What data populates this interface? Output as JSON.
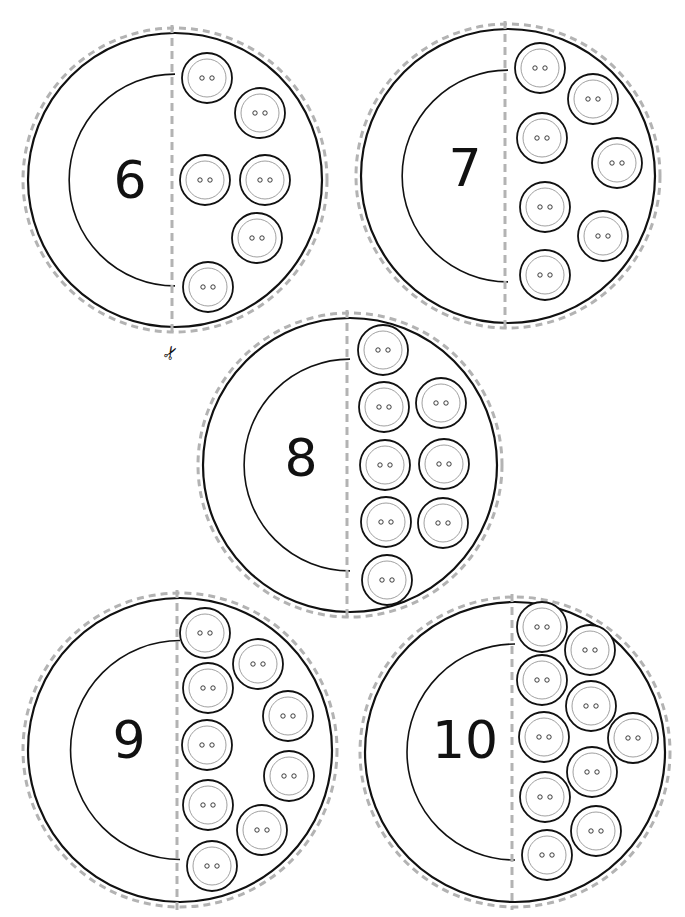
{
  "page": {
    "colors": {
      "line": "#111111",
      "dash": "#b3b3b3",
      "button_inner": "#888888",
      "background": "#ffffff"
    }
  },
  "icons": {
    "scissors": "✂"
  },
  "cards": [
    {
      "number": "6",
      "count": 6,
      "cx": 175,
      "cy": 180,
      "r": 147,
      "buttons": [
        [
          207,
          78
        ],
        [
          260,
          113
        ],
        [
          205,
          180
        ],
        [
          265,
          180
        ],
        [
          257,
          238
        ],
        [
          208,
          287
        ]
      ]
    },
    {
      "number": "7",
      "count": 7,
      "cx": 508,
      "cy": 176,
      "r": 147,
      "buttons": [
        [
          540,
          68
        ],
        [
          593,
          99
        ],
        [
          542,
          138
        ],
        [
          617,
          163
        ],
        [
          545,
          207
        ],
        [
          603,
          236
        ],
        [
          545,
          275
        ]
      ]
    },
    {
      "number": "8",
      "count": 8,
      "cx": 350,
      "cy": 465,
      "r": 147,
      "buttons": [
        [
          383,
          350
        ],
        [
          441,
          403
        ],
        [
          384,
          407
        ],
        [
          444,
          464
        ],
        [
          385,
          465
        ],
        [
          443,
          523
        ],
        [
          386,
          522
        ],
        [
          387,
          580
        ]
      ]
    },
    {
      "number": "9",
      "count": 9,
      "cx": 180,
      "cy": 750,
      "r": 152,
      "buttons": [
        [
          205,
          633
        ],
        [
          258,
          664
        ],
        [
          208,
          688
        ],
        [
          288,
          716
        ],
        [
          207,
          745
        ],
        [
          289,
          776
        ],
        [
          208,
          805
        ],
        [
          262,
          830
        ],
        [
          212,
          866
        ]
      ]
    },
    {
      "number": "10",
      "count": 10,
      "cx": 515,
      "cy": 752,
      "r": 150,
      "buttons": [
        [
          542,
          627
        ],
        [
          590,
          650
        ],
        [
          542,
          680
        ],
        [
          591,
          706
        ],
        [
          544,
          737
        ],
        [
          633,
          738
        ],
        [
          592,
          772
        ],
        [
          545,
          797
        ],
        [
          596,
          831
        ],
        [
          547,
          855
        ]
      ]
    }
  ]
}
